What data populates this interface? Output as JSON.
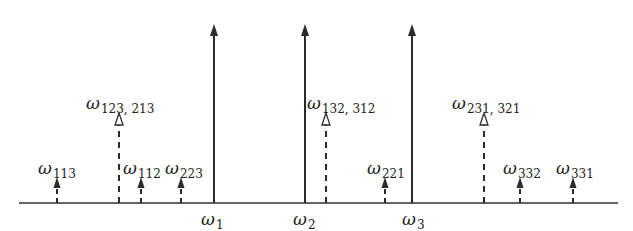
{
  "diagram": {
    "axis": {
      "x_start": 19,
      "x_end": 618,
      "y": 203,
      "color": "#333333"
    },
    "colors": {
      "line": "#2b2b2b",
      "label": "#222222",
      "background": "#ffffff"
    },
    "fundamentals": [
      {
        "id": "w1",
        "symbol": "ω",
        "subscript": "1",
        "x": 214,
        "tip_y": 24
      },
      {
        "id": "w2",
        "symbol": "ω",
        "subscript": "2",
        "x": 305,
        "tip_y": 24
      },
      {
        "id": "w3",
        "symbol": "ω",
        "subscript": "3",
        "x": 412,
        "tip_y": 24
      }
    ],
    "combined_products": [
      {
        "id": "w123_213",
        "symbol": "ω",
        "subscript": "123, 213",
        "x": 119,
        "tip_y": 113,
        "label_x": 86,
        "label_y": 95
      },
      {
        "id": "w132_312",
        "symbol": "ω",
        "subscript": "132, 312",
        "x": 326,
        "tip_y": 113,
        "label_x": 307,
        "label_y": 95
      },
      {
        "id": "w231_321",
        "symbol": "ω",
        "subscript": "231, 321",
        "x": 484,
        "tip_y": 113,
        "label_x": 452,
        "label_y": 95
      }
    ],
    "single_products": [
      {
        "id": "w113",
        "symbol": "ω",
        "subscript": "113",
        "x": 57,
        "tip_y": 177,
        "label_x": 38,
        "label_y": 160
      },
      {
        "id": "w112",
        "symbol": "ω",
        "subscript": "112",
        "x": 141,
        "tip_y": 177,
        "label_x": 123,
        "label_y": 160
      },
      {
        "id": "w223",
        "symbol": "ω",
        "subscript": "223",
        "x": 181,
        "tip_y": 177,
        "label_x": 165,
        "label_y": 160
      },
      {
        "id": "w221",
        "symbol": "ω",
        "subscript": "221",
        "x": 385,
        "tip_y": 177,
        "label_x": 367,
        "label_y": 160
      },
      {
        "id": "w332",
        "symbol": "ω",
        "subscript": "332",
        "x": 520,
        "tip_y": 177,
        "label_x": 503,
        "label_y": 160
      },
      {
        "id": "w331",
        "symbol": "ω",
        "subscript": "331",
        "x": 573,
        "tip_y": 177,
        "label_x": 556,
        "label_y": 160
      }
    ],
    "axis_labels": [
      {
        "symbol": "ω",
        "subscript": "1",
        "x": 201,
        "y": 211
      },
      {
        "symbol": "ω",
        "subscript": "2",
        "x": 293,
        "y": 211
      },
      {
        "symbol": "ω",
        "subscript": "3",
        "x": 402,
        "y": 211
      }
    ]
  }
}
